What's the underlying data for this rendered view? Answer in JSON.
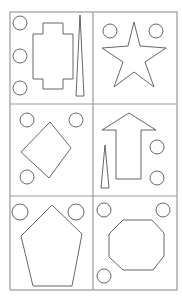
{
  "grid": {
    "rows": 3,
    "cols": 2,
    "border_color": "#999999",
    "stroke_color": "#555555"
  },
  "panels": [
    {
      "id": "p1",
      "shapes": [
        "cross-rectangle",
        "tall-thin-triangle"
      ],
      "circles": 3
    },
    {
      "id": "p2",
      "shapes": [
        "star"
      ],
      "circles": 2
    },
    {
      "id": "p3",
      "shapes": [
        "diamond"
      ],
      "circles": 3
    },
    {
      "id": "p4",
      "shapes": [
        "up-arrow",
        "tall-thin-triangle"
      ],
      "circles": 2
    },
    {
      "id": "p5",
      "shapes": [
        "pentagon"
      ],
      "circles": 2
    },
    {
      "id": "p6",
      "shapes": [
        "octagon"
      ],
      "circles": 3
    }
  ]
}
